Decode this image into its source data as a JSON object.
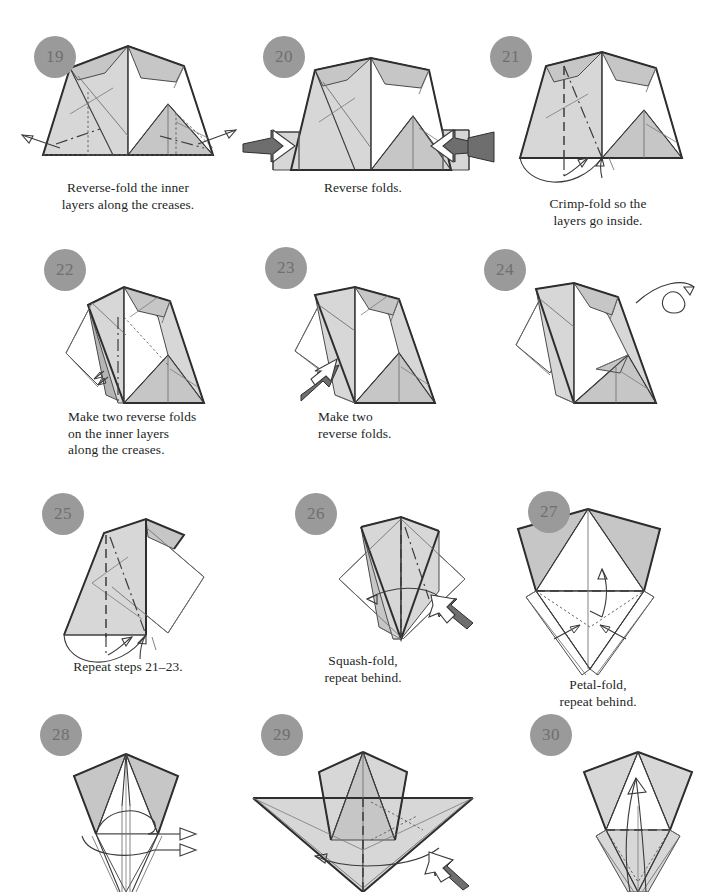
{
  "page": {
    "width": 721,
    "height": 889,
    "background": "#ffffff",
    "badge_color": "#9a9a9a",
    "badge_text_color": "#6f6f6f",
    "paper_front_color": "#d7d7d7",
    "paper_shade_color": "#c6c6c6",
    "paper_back_color": "#ffffff",
    "line_color": "#3a3a3a",
    "arrow_fill": "#6a6a6a"
  },
  "steps": [
    {
      "number": "19",
      "caption": "Reverse-fold the inner\nlayers along the creases.",
      "caption_align": "center",
      "arrows": [
        "outward-left-arrow",
        "outward-right-arrow"
      ]
    },
    {
      "number": "20",
      "caption": "Reverse folds.",
      "caption_align": "center",
      "arrows": [
        "push-arrow-left",
        "push-arrow-right"
      ]
    },
    {
      "number": "21",
      "caption": "Crimp-fold so the\nlayers go inside.",
      "caption_align": "center",
      "arrows": [
        "crimp-arrow"
      ]
    },
    {
      "number": "22",
      "caption": "Make two reverse folds\non the inner layers\nalong the creases.",
      "caption_align": "left",
      "arrows": [
        "double-small-arrow"
      ]
    },
    {
      "number": "23",
      "caption": "Make two\nreverse folds.",
      "caption_align": "left",
      "arrows": [
        "push-arrow-diagonal",
        "hollow-arrow-diagonal"
      ]
    },
    {
      "number": "24",
      "caption": "",
      "caption_align": "center",
      "arrows": [
        "turn-over-arrow"
      ]
    },
    {
      "number": "25",
      "caption": "Repeat steps 21–23.",
      "caption_align": "center",
      "arrows": [
        "crimp-arrow"
      ]
    },
    {
      "number": "26",
      "caption": "Squash-fold,\nrepeat behind.",
      "caption_align": "center",
      "arrows": [
        "squash-arrow",
        "push-arrow-diagonal"
      ]
    },
    {
      "number": "27",
      "caption": "Petal-fold,\nrepeat behind.",
      "caption_align": "center",
      "arrows": [
        "up-arrow",
        "inward-left-arrow",
        "inward-right-arrow"
      ]
    },
    {
      "number": "28",
      "caption": "",
      "caption_align": "center",
      "arrows": [
        "hollow-arrow-right-top",
        "hollow-arrow-right-bottom"
      ]
    },
    {
      "number": "29",
      "caption": "",
      "caption_align": "center",
      "arrows": [
        "sweep-left-arrow",
        "push-arrow-diagonal"
      ]
    },
    {
      "number": "30",
      "caption": "",
      "caption_align": "center",
      "arrows": [
        "up-curve-arrow"
      ]
    }
  ]
}
